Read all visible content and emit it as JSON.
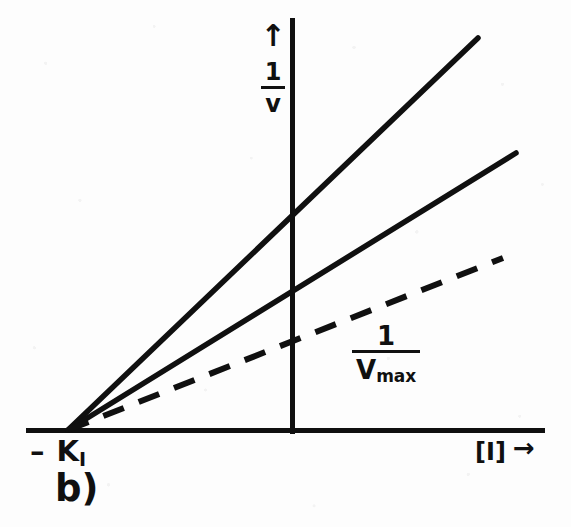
{
  "figure": {
    "panel_letter": "b)",
    "background_color": "#fdfdfd",
    "ink_color": "#101010"
  },
  "axes": {
    "y_axis": {
      "arrow_glyph": "↑",
      "label_numerator": "1",
      "label_denominator": "v",
      "label_text": "1/v"
    },
    "x_axis": {
      "label_text": "[I]",
      "arrow_glyph": "→"
    },
    "x_intercept_label": "– K",
    "x_intercept_subscript": "I",
    "x_intercept_full": "-K_I"
  },
  "annotations": {
    "vmax": {
      "numerator": "1",
      "denominator": "V",
      "denominator_subscript": "max",
      "full_text": "1/Vmax"
    }
  },
  "chart_data": {
    "type": "line",
    "title": "",
    "subtitle": "",
    "xlabel": "[I]",
    "ylabel": "1/v",
    "grid": false,
    "legend": "none",
    "common_intersection": {
      "x": -1.0,
      "y": 0.0,
      "label": "-K_I"
    },
    "axis_origin_pixel": {
      "x": 292,
      "y": 430
    },
    "xlim": [
      -1.25,
      6.0
    ],
    "ylim": [
      0,
      4.4
    ],
    "series": [
      {
        "name": "line-steep",
        "style": "solid",
        "slope_relative": 1.0,
        "y_intercept_value": 2.33,
        "points": [
          {
            "x": -1.0,
            "y": 0.0
          },
          {
            "x": 0.0,
            "y": 2.33
          },
          {
            "x": 4.5,
            "y": 4.3
          }
        ],
        "pixel_start": {
          "x": 68,
          "y": 430
        },
        "pixel_y_axis_crossing": {
          "x": 292,
          "y": 212
        },
        "pixel_end": {
          "x": 478,
          "y": 38
        }
      },
      {
        "name": "line-medium",
        "style": "solid",
        "slope_relative": 0.64,
        "y_intercept_value": 1.49,
        "points": [
          {
            "x": -1.0,
            "y": 0.0
          },
          {
            "x": 0.0,
            "y": 1.49
          },
          {
            "x": 5.1,
            "y": 3.1
          }
        ],
        "pixel_start": {
          "x": 68,
          "y": 430
        },
        "pixel_y_axis_crossing": {
          "x": 292,
          "y": 287
        },
        "pixel_end": {
          "x": 516,
          "y": 153
        }
      },
      {
        "name": "line-shallow-dashed",
        "style": "dashed",
        "slope_relative": 0.47,
        "y_intercept_value": 1.08,
        "points": [
          {
            "x": -1.0,
            "y": 0.0
          },
          {
            "x": 0.0,
            "y": 1.08
          },
          {
            "x": 4.9,
            "y": 2.22
          }
        ],
        "pixel_start": {
          "x": 68,
          "y": 430
        },
        "pixel_y_axis_crossing": {
          "x": 292,
          "y": 325
        },
        "pixel_end": {
          "x": 503,
          "y": 258
        }
      }
    ]
  }
}
